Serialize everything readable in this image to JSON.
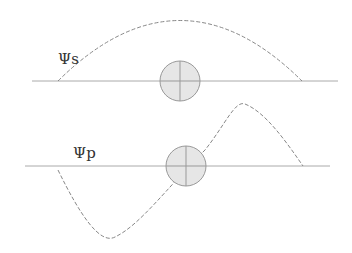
{
  "diagram": {
    "s_orbital": {
      "label": "Ψs",
      "axis_y": 81,
      "axis_x": [
        32,
        338
      ],
      "wave": "M 58 81 Q 180 -40 302 81",
      "nucleus": {
        "cx": 180,
        "cy": 81,
        "r": 20
      }
    },
    "p_orbital": {
      "label": "Ψp",
      "axis_y": 166,
      "axis_x": [
        25,
        330
      ],
      "wave": "M 58 170 C 90 240, 120 250, 150 205 S 210 120, 240 105 S 280 110, 303 166",
      "nucleus": {
        "cx": 186,
        "cy": 166,
        "r": 20
      }
    },
    "colors": {
      "axis": "#aaaaaa",
      "wave": "#888888",
      "nucleus_fill": "#e6e6e6",
      "nucleus_stroke": "#999999",
      "label": "#333333"
    }
  }
}
